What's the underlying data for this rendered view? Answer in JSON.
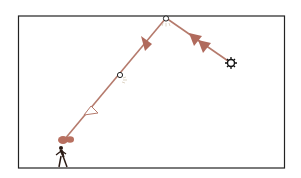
{
  "diagram": {
    "colors": {
      "ray": "#b06a5c",
      "frame": "#222222",
      "sun": "#111111",
      "figure": "#2a1a14",
      "glow": "#c0a890"
    },
    "nodes": [
      {
        "id": "sun",
        "x": 231,
        "y": 63
      },
      {
        "id": "reflection-point",
        "x": 166,
        "y": 18
      },
      {
        "id": "mid-point",
        "x": 120,
        "y": 75
      },
      {
        "id": "observer-eye",
        "x": 64,
        "y": 140
      }
    ],
    "labels": []
  }
}
